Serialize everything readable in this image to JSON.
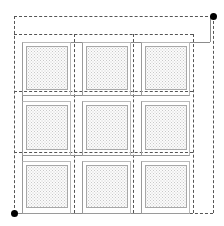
{
  "diagram": {
    "canvas": {
      "width": 224,
      "height": 226,
      "background": "#ffffff"
    },
    "colors": {
      "dashed_guide": "#555555",
      "solid_structure": "#8c8c8c",
      "panel_border": "#a8a8a8",
      "panel_fill": "#fbfbfb",
      "panel_stipple": "#c9c9c9",
      "node": "#000000"
    },
    "legend_note": "",
    "nodes": [
      {
        "name": "node-top-right",
        "x": 213,
        "y": 16,
        "label": ""
      },
      {
        "name": "node-bottom-left",
        "x": 14,
        "y": 213,
        "label": ""
      }
    ],
    "dashed_lines_horizontal": [
      {
        "name": "guide-top-outer",
        "y": 16,
        "x1": 14,
        "x2": 213
      },
      {
        "name": "guide-top-inner",
        "y": 34,
        "x1": 14,
        "x2": 193
      },
      {
        "name": "guide-row1-bottom",
        "y": 91,
        "x1": 14,
        "x2": 193
      },
      {
        "name": "guide-row2-bottom",
        "y": 152,
        "x1": 14,
        "x2": 193
      },
      {
        "name": "guide-bottom",
        "y": 213,
        "x1": 14,
        "x2": 213
      }
    ],
    "dashed_lines_vertical": [
      {
        "name": "guide-left",
        "x": 14,
        "y1": 16,
        "y2": 213
      },
      {
        "name": "guide-col1-right",
        "x": 74,
        "y1": 34,
        "y2": 213
      },
      {
        "name": "guide-col2-right",
        "x": 133,
        "y1": 34,
        "y2": 213
      },
      {
        "name": "guide-col3-right",
        "x": 193,
        "y1": 34,
        "y2": 213
      },
      {
        "name": "guide-right-outer",
        "x": 213,
        "y1": 16,
        "y2": 213
      }
    ],
    "solid_lines": [
      {
        "name": "feeder-vertical-right",
        "orientation": "v",
        "x": 210,
        "y1": 16,
        "y2": 42
      },
      {
        "name": "feeder-horizontal-top",
        "orientation": "h",
        "y": 42,
        "x1": 22,
        "x2": 210
      },
      {
        "name": "bus-row1-bottom",
        "orientation": "h",
        "y": 95,
        "x1": 22,
        "x2": 185
      },
      {
        "name": "bus-row2-bottom",
        "orientation": "h",
        "y": 155,
        "x1": 22,
        "x2": 185
      },
      {
        "name": "bus-bottom",
        "orientation": "h",
        "y": 213,
        "x1": 14,
        "x2": 185
      },
      {
        "name": "riser-left",
        "orientation": "v",
        "x": 22,
        "y1": 42,
        "y2": 213
      }
    ],
    "grid": {
      "rows": 3,
      "columns": 3,
      "row_labels": [
        "Row 1",
        "Row 2",
        "Row 3"
      ],
      "column_labels": [
        "Col A",
        "Col B",
        "Col C"
      ]
    },
    "modules": [
      {
        "id": "module-r1c1",
        "row": 1,
        "col": 1,
        "frame": {
          "x": 22,
          "y": 42,
          "w": 49,
          "h": 54
        },
        "panel": {
          "x": 26,
          "y": 46,
          "w": 42,
          "h": 44
        }
      },
      {
        "id": "module-r1c2",
        "row": 1,
        "col": 2,
        "frame": {
          "x": 82,
          "y": 42,
          "w": 49,
          "h": 54
        },
        "panel": {
          "x": 86,
          "y": 46,
          "w": 42,
          "h": 44
        }
      },
      {
        "id": "module-r1c3",
        "row": 1,
        "col": 3,
        "frame": {
          "x": 141,
          "y": 42,
          "w": 49,
          "h": 54
        },
        "panel": {
          "x": 145,
          "y": 46,
          "w": 42,
          "h": 44
        }
      },
      {
        "id": "module-r2c1",
        "row": 2,
        "col": 1,
        "frame": {
          "x": 22,
          "y": 101,
          "w": 49,
          "h": 55
        },
        "panel": {
          "x": 26,
          "y": 105,
          "w": 42,
          "h": 45
        }
      },
      {
        "id": "module-r2c2",
        "row": 2,
        "col": 2,
        "frame": {
          "x": 82,
          "y": 101,
          "w": 49,
          "h": 55
        },
        "panel": {
          "x": 86,
          "y": 105,
          "w": 42,
          "h": 45
        }
      },
      {
        "id": "module-r2c3",
        "row": 2,
        "col": 3,
        "frame": {
          "x": 141,
          "y": 101,
          "w": 49,
          "h": 55
        },
        "panel": {
          "x": 145,
          "y": 105,
          "w": 42,
          "h": 45
        }
      },
      {
        "id": "module-r3c1",
        "row": 3,
        "col": 1,
        "frame": {
          "x": 22,
          "y": 161,
          "w": 49,
          "h": 53
        },
        "panel": {
          "x": 26,
          "y": 165,
          "w": 42,
          "h": 43
        }
      },
      {
        "id": "module-r3c2",
        "row": 3,
        "col": 2,
        "frame": {
          "x": 82,
          "y": 161,
          "w": 49,
          "h": 53
        },
        "panel": {
          "x": 86,
          "y": 165,
          "w": 42,
          "h": 43
        }
      },
      {
        "id": "module-r3c3",
        "row": 3,
        "col": 3,
        "frame": {
          "x": 141,
          "y": 161,
          "w": 49,
          "h": 53
        },
        "panel": {
          "x": 145,
          "y": 165,
          "w": 42,
          "h": 43
        }
      }
    ]
  }
}
